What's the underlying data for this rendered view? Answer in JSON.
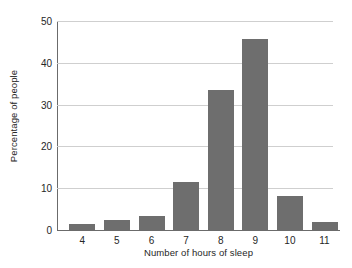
{
  "chart_data": {
    "type": "bar",
    "title": "",
    "xlabel": "Number of hours of sleep",
    "ylabel": "Percentage of people",
    "categories": [
      "4",
      "5",
      "6",
      "7",
      "8",
      "9",
      "10",
      "11"
    ],
    "values": [
      1.4,
      2.4,
      3.3,
      11.4,
      33.5,
      45.6,
      8.2,
      2.0
    ],
    "ylim": [
      0,
      50
    ],
    "yticks": [
      0,
      10,
      20,
      30,
      40,
      50
    ],
    "ytick_labels": [
      "0",
      "10",
      "20",
      "30",
      "40",
      "50"
    ],
    "grid": "horizontal",
    "legend": "none",
    "bar_color": "#6e6e6e",
    "grid_color": "#cfcfcf",
    "axis_color": "#6b6b6b",
    "background": "#ffffff"
  }
}
